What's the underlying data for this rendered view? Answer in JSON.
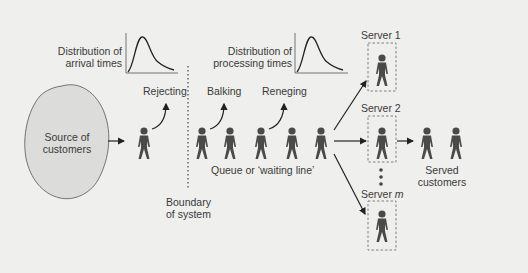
{
  "diagram": {
    "source": {
      "line1": "Source of",
      "line2": "customers"
    },
    "arrival_dist": {
      "line1": "Distribution of",
      "line2": "arrival times"
    },
    "processing_dist": {
      "line1": "Distribution of",
      "line2": "processing times"
    },
    "rejecting": "Rejecting",
    "balking": "Balking",
    "reneging": "Reneging",
    "queue": "Queue or ‘waiting line’",
    "boundary": {
      "line1": "Boundary",
      "line2": "of system"
    },
    "servers": [
      {
        "label": "Server 1"
      },
      {
        "label": "Server 2"
      },
      {
        "label": "Server ",
        "suffix": "m"
      }
    ],
    "served": {
      "line1": "Served",
      "line2": "customers"
    },
    "colors": {
      "figure": "#4a4a4a",
      "blob": "#dcdcda",
      "background": "#efefed"
    }
  }
}
